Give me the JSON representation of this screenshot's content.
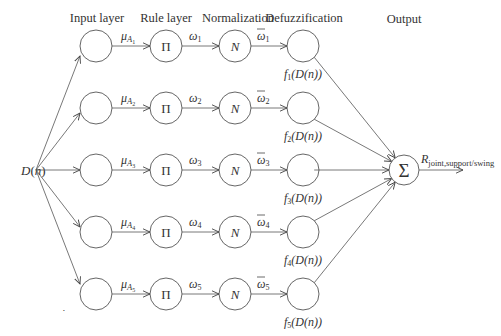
{
  "headers": {
    "input": "Input layer",
    "rule": "Rule layer",
    "normalization": "Normalization",
    "defuzzification": "Defuzzification",
    "output": "Output"
  },
  "input_label": "D(n)",
  "rule_symbol": "Π",
  "norm_symbol": "N",
  "sum_symbol": "Σ",
  "output_label": {
    "main": "R",
    "subscript": "joint,support/swing"
  },
  "rows": [
    {
      "mu_main": "μ",
      "mu_sub": "A",
      "mu_subsub": "1",
      "w": "ω",
      "w_sub": "1",
      "wbar": "ω",
      "wbar_sub": "1",
      "f_main": "f",
      "f_sub": "1",
      "f_arg": "(D(n))"
    },
    {
      "mu_main": "μ",
      "mu_sub": "A",
      "mu_subsub": "2",
      "w": "ω",
      "w_sub": "2",
      "wbar": "ω",
      "wbar_sub": "2",
      "f_main": "f",
      "f_sub": "2",
      "f_arg": "(D(n))"
    },
    {
      "mu_main": "μ",
      "mu_sub": "A",
      "mu_subsub": "3",
      "w": "ω",
      "w_sub": "3",
      "wbar": "ω",
      "wbar_sub": "3",
      "f_main": "f",
      "f_sub": "3",
      "f_arg": "(D(n))"
    },
    {
      "mu_main": "μ",
      "mu_sub": "A",
      "mu_subsub": "4",
      "w": "ω",
      "w_sub": "4",
      "wbar": "ω",
      "wbar_sub": "4",
      "f_main": "f",
      "f_sub": "4",
      "f_arg": "(D(n))"
    },
    {
      "mu_main": "μ",
      "mu_sub": "A",
      "mu_subsub": "5",
      "w": "ω",
      "w_sub": "5",
      "wbar": "ω",
      "wbar_sub": "5",
      "f_main": "f",
      "f_sub": "5",
      "f_arg": "(D(n))"
    }
  ],
  "stray_mark": "•"
}
